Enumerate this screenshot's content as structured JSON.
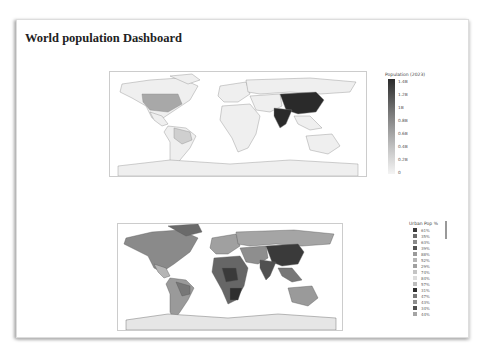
{
  "page": {
    "title": "World population Dashboard"
  },
  "map1": {
    "name": "population-choropleth",
    "colorbar_title": "Population (2023)",
    "ticks": [
      "1.4B",
      "1.2B",
      "1B",
      "0.8B",
      "0.6B",
      "0.4B",
      "0.2B",
      "0"
    ],
    "highlight_colors": {
      "china_india": "#2a2a2a",
      "usa": "#a8a8a8",
      "brazil": "#cfcfcf",
      "base": "#efefef"
    }
  },
  "map2": {
    "name": "urban-pop-choropleth",
    "legend_title": "Urban Pop %",
    "items": [
      {
        "label": "61%",
        "color": "#3a3a3a"
      },
      {
        "label": "35%",
        "color": "#6a6a6a"
      },
      {
        "label": "63%",
        "color": "#8a8a8a"
      },
      {
        "label": "39%",
        "color": "#555555"
      },
      {
        "label": "88%",
        "color": "#9a9a9a"
      },
      {
        "label": "52%",
        "color": "#b5b5b5"
      },
      {
        "label": "29%",
        "color": "#a0a0a0"
      },
      {
        "label": "74%",
        "color": "#c4c4c4"
      },
      {
        "label": "84%",
        "color": "#dcdcdc"
      },
      {
        "label": "57%",
        "color": "#bdbdbd"
      },
      {
        "label": "31%",
        "color": "#2e2e2e"
      },
      {
        "label": "47%",
        "color": "#777777"
      },
      {
        "label": "43%",
        "color": "#8e8e8e"
      },
      {
        "label": "34%",
        "color": "#505050"
      },
      {
        "label": "44%",
        "color": "#a5a5a5"
      }
    ]
  }
}
